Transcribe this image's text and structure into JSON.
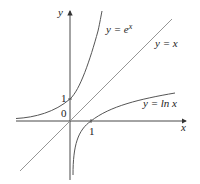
{
  "figure": {
    "axes": {
      "x_label": "x",
      "y_label": "y",
      "origin_label": "0",
      "x_tick_label": "1",
      "y_tick_label": "1"
    },
    "curves": [
      {
        "name": "exp",
        "label_prefix": "y = ",
        "label_func": "e",
        "label_sup": "x"
      },
      {
        "name": "identity",
        "label": "y = x"
      },
      {
        "name": "log",
        "label": "y = ln x"
      }
    ],
    "colors": {
      "curve": "#555555",
      "axis": "#333333",
      "line": "#8a8a8a"
    }
  }
}
